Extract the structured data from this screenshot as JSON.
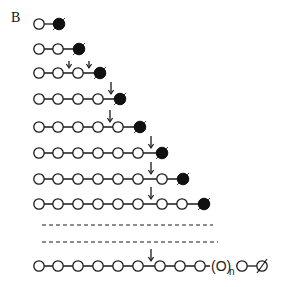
{
  "panel_label": "B",
  "colors": {
    "stroke": "#1a1a1a",
    "open_fill": "#ffffff",
    "filled": "#111111"
  },
  "rows": [
    {
      "y": 24,
      "open": [
        39
      ],
      "filled": 59,
      "arrows": []
    },
    {
      "y": 49,
      "open": [
        39,
        58
      ],
      "filled": 79,
      "arrows": []
    },
    {
      "y": 73,
      "open": [
        39,
        58,
        78
      ],
      "filled": 100,
      "arrows": [
        69,
        89
      ],
      "small_arrows": true
    },
    {
      "y": 99,
      "open": [
        39,
        58,
        78,
        98
      ],
      "filled": 120,
      "arrows": [
        111
      ]
    },
    {
      "y": 127,
      "open": [
        39,
        58,
        78,
        98,
        118
      ],
      "filled": 140,
      "arrows": [
        110
      ]
    },
    {
      "y": 153,
      "open": [
        39,
        58,
        78,
        98,
        118,
        138
      ],
      "filled": 162,
      "arrows": [
        151
      ]
    },
    {
      "y": 179,
      "open": [
        39,
        58,
        78,
        98,
        118,
        138,
        162
      ],
      "filled": 183,
      "arrows": [
        151
      ]
    },
    {
      "y": 204,
      "open": [
        39,
        58,
        78,
        98,
        118,
        138,
        162,
        182
      ],
      "filled": 204,
      "arrows": [
        151
      ]
    }
  ],
  "dashed_lines": [
    {
      "y": 225,
      "x1": 42,
      "x2": 213
    },
    {
      "y": 242,
      "x1": 42,
      "x2": 218
    }
  ],
  "final_row": {
    "y": 266,
    "open": [
      39,
      58,
      78,
      98,
      118,
      138,
      160,
      180,
      200
    ],
    "arrow": 151,
    "repeat_label": "(O)",
    "repeat_subscript": "n",
    "repeat_x": 212,
    "after_repeat": 242,
    "terminal_symbol": "∅",
    "terminal_x": 262
  }
}
